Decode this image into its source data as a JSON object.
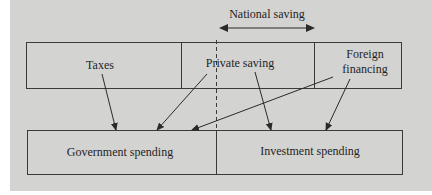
{
  "diagram": {
    "header": {
      "label": "National saving",
      "arrow": "double-headed"
    },
    "top_row": {
      "cells": [
        {
          "id": "taxes",
          "label": "Taxes"
        },
        {
          "id": "private_saving",
          "label": "Private saving"
        },
        {
          "id": "foreign_financing",
          "label": "Foreign\nfinancing",
          "line1": "Foreign",
          "line2": "financing"
        }
      ]
    },
    "bottom_row": {
      "cells": [
        {
          "id": "government_spending",
          "label": "Government spending"
        },
        {
          "id": "investment_spending",
          "label": "Investment spending"
        }
      ]
    },
    "flows": [
      {
        "from": "Taxes",
        "to": "Government spending"
      },
      {
        "from": "Private saving",
        "to": "Government spending"
      },
      {
        "from": "Private saving",
        "to": "Investment spending"
      },
      {
        "from": "Foreign financing",
        "to": "Government spending"
      },
      {
        "from": "Foreign financing",
        "to": "Investment spending"
      }
    ],
    "colors": {
      "background": "#d3d3d1",
      "line": "#333333",
      "text": "#1f1f1f"
    }
  }
}
